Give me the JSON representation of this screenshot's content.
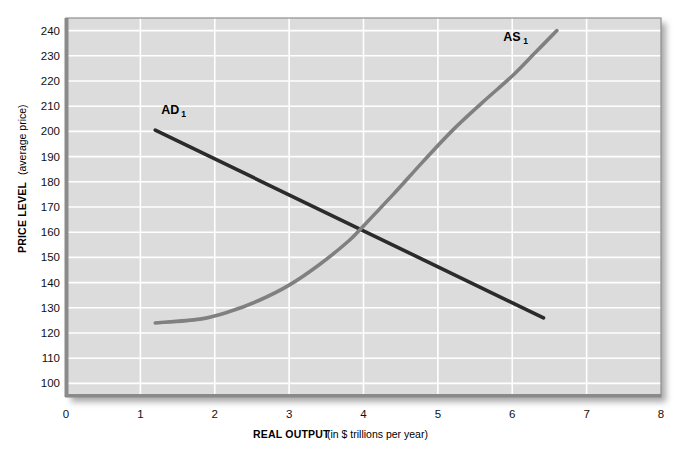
{
  "chart_data": {
    "type": "line",
    "title": "",
    "xlabel_bold": "REAL OUTPUT",
    "xlabel_regular": "(in $ trillions per year)",
    "ylabel_bold": "PRICE LEVEL",
    "ylabel_regular": "(average price)",
    "xlim": [
      0,
      8
    ],
    "ylim": [
      95,
      245
    ],
    "x_ticks": [
      "0",
      "1",
      "2",
      "3",
      "4",
      "5",
      "6",
      "7",
      "8"
    ],
    "y_ticks": [
      "100",
      "110",
      "120",
      "130",
      "140",
      "150",
      "160",
      "170",
      "180",
      "190",
      "200",
      "210",
      "220",
      "230",
      "240"
    ],
    "grid": true,
    "legend_position": "inline-annotations",
    "colors": {
      "plot_background": "#dcdcdc",
      "gridline": "#ffffff",
      "axis_border": "#8c8c8c",
      "ad_curve": "#2b2b2b",
      "as_curve": "#808080",
      "page_background": "#ffffff"
    },
    "series": [
      {
        "name": "AD1",
        "label": "AD",
        "label_subscript": "1",
        "label_x": 1.28,
        "label_y": 207,
        "color": "#2b2b2b",
        "shape": "straight-line",
        "points": [
          {
            "x": 1.2,
            "y": 200.5
          },
          {
            "x": 6.42,
            "y": 126.0
          }
        ]
      },
      {
        "name": "AS1",
        "label": "AS",
        "label_subscript": "1",
        "label_x": 5.88,
        "label_y": 236,
        "color": "#808080",
        "shape": "upward-sloping-curve",
        "points": [
          {
            "x": 1.2,
            "y": 124.0
          },
          {
            "x": 1.8,
            "y": 125.5
          },
          {
            "x": 2.2,
            "y": 128.5
          },
          {
            "x": 2.6,
            "y": 133.0
          },
          {
            "x": 3.0,
            "y": 139.0
          },
          {
            "x": 3.4,
            "y": 147.0
          },
          {
            "x": 3.8,
            "y": 156.5
          },
          {
            "x": 4.0,
            "y": 162.5
          },
          {
            "x": 4.4,
            "y": 175.0
          },
          {
            "x": 4.8,
            "y": 188.0
          },
          {
            "x": 5.2,
            "y": 200.5
          },
          {
            "x": 5.6,
            "y": 211.5
          },
          {
            "x": 6.0,
            "y": 222.0
          },
          {
            "x": 6.3,
            "y": 231.0
          },
          {
            "x": 6.6,
            "y": 240.0
          }
        ]
      }
    ],
    "equilibrium": {
      "x": 4.0,
      "y": 163
    }
  }
}
